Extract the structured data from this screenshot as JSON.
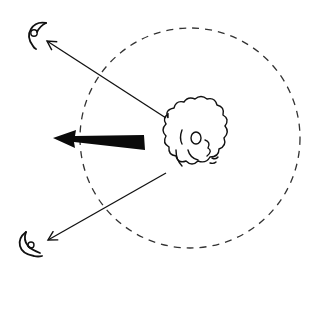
{
  "diagram": {
    "type": "sound-source-with-listeners",
    "colors": {
      "background": "#ffffff",
      "stroke": "#111111",
      "dashed_circle": "#333333"
    },
    "elements": {
      "source": {
        "shape": "cloud-head",
        "cx": 198,
        "cy": 152
      },
      "boundary_circle": {
        "style": "dashed",
        "cx": 190,
        "cy": 138,
        "r": 110
      },
      "main_direction_arrow": {
        "style": "thick-filled",
        "direction": "left",
        "from": [
          145,
          143
        ],
        "to": [
          53,
          138
        ]
      },
      "listeners": [
        {
          "icon": "ear-icon",
          "position": "top-left",
          "x": 38,
          "y": 33
        },
        {
          "icon": "ear-icon",
          "position": "bottom-left",
          "x": 25,
          "y": 242
        }
      ],
      "thin_arrows": [
        {
          "from": [
            166,
            118
          ],
          "to": [
            47,
            41
          ]
        },
        {
          "from": [
            166,
            173
          ],
          "to": [
            48,
            240
          ]
        }
      ]
    }
  }
}
